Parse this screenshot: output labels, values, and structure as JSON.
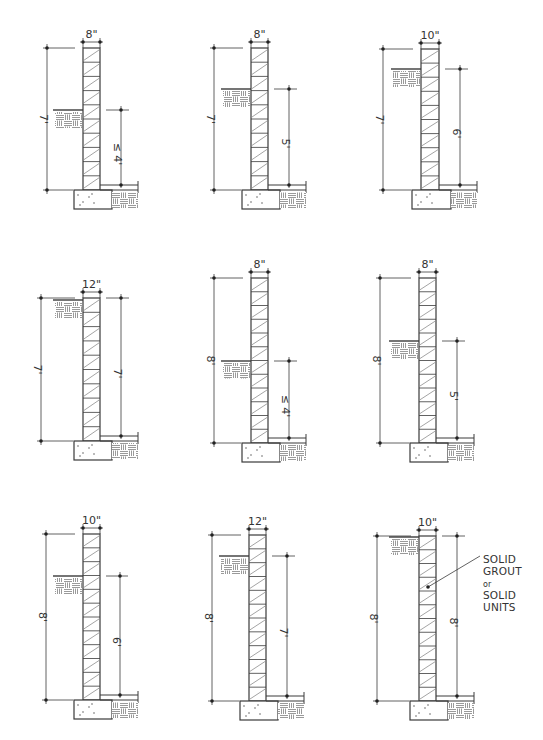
{
  "diagram": {
    "colors": {
      "line": "#3a3a3a",
      "hatch": "#555555",
      "background": "#ffffff"
    },
    "panels": [
      {
        "id": 1,
        "row": 1,
        "col": 1,
        "wall_thickness": "8\"",
        "total_height": "7'",
        "backfill_height": "≤ 4'",
        "backfill_prefix": "≤",
        "backfill_value": "4'",
        "geom": {
          "wallL": 83,
          "wallR": 100,
          "top": 48,
          "base": 190,
          "grade": 110,
          "leftDimX": 47,
          "rightDimX": 121
        }
      },
      {
        "id": 2,
        "row": 1,
        "col": 2,
        "wall_thickness": "8\"",
        "total_height": "7'",
        "backfill_height": "5'",
        "backfill_prefix": "",
        "backfill_value": "5'",
        "geom": {
          "wallL": 251,
          "wallR": 268,
          "top": 48,
          "base": 190,
          "grade": 89,
          "leftDimX": 214,
          "rightDimX": 289
        }
      },
      {
        "id": 3,
        "row": 1,
        "col": 3,
        "wall_thickness": "10\"",
        "total_height": "7'",
        "backfill_height": "6'",
        "backfill_prefix": "",
        "backfill_value": "6'",
        "geom": {
          "wallL": 421,
          "wallR": 439,
          "top": 49,
          "base": 190,
          "grade": 69,
          "leftDimX": 383,
          "rightDimX": 460
        }
      },
      {
        "id": 4,
        "row": 2,
        "col": 1,
        "wall_thickness": "12\"",
        "total_height": "7'",
        "backfill_height": "7'",
        "backfill_prefix": "",
        "backfill_value": "7'",
        "geom": {
          "wallL": 83,
          "wallR": 100,
          "top": 298,
          "base": 441,
          "grade": 300,
          "leftDimX": 41,
          "rightDimX": 121
        }
      },
      {
        "id": 5,
        "row": 2,
        "col": 2,
        "wall_thickness": "8\"",
        "total_height": "8'",
        "backfill_height": "≤ 4'",
        "backfill_prefix": "≤",
        "backfill_value": "4'",
        "geom": {
          "wallL": 251,
          "wallR": 268,
          "top": 278,
          "base": 443,
          "grade": 361,
          "leftDimX": 214,
          "rightDimX": 289
        }
      },
      {
        "id": 6,
        "row": 2,
        "col": 3,
        "wall_thickness": "8\"",
        "total_height": "8'",
        "backfill_height": "5'",
        "backfill_prefix": "",
        "backfill_value": "5'",
        "geom": {
          "wallL": 419,
          "wallR": 436,
          "top": 278,
          "base": 443,
          "grade": 341,
          "leftDimX": 380,
          "rightDimX": 457
        }
      },
      {
        "id": 7,
        "row": 3,
        "col": 1,
        "wall_thickness": "10\"",
        "total_height": "8'",
        "backfill_height": "6'",
        "backfill_prefix": "",
        "backfill_value": "6'",
        "geom": {
          "wallL": 83,
          "wallR": 100,
          "top": 534,
          "base": 700,
          "grade": 576,
          "leftDimX": 46,
          "rightDimX": 120
        }
      },
      {
        "id": 8,
        "row": 3,
        "col": 2,
        "wall_thickness": "12\"",
        "total_height": "8'",
        "backfill_height": "7'",
        "backfill_prefix": "",
        "backfill_value": "7'",
        "geom": {
          "wallL": 249,
          "wallR": 266,
          "top": 535,
          "base": 701,
          "grade": 556,
          "leftDimX": 212,
          "rightDimX": 287
        }
      },
      {
        "id": 9,
        "row": 3,
        "col": 3,
        "wall_thickness": "10\"",
        "total_height": "8'",
        "backfill_height": "8'",
        "backfill_prefix": "",
        "backfill_value": "8'",
        "geom": {
          "wallL": 419,
          "wallR": 436,
          "top": 536,
          "base": 701,
          "grade": 537,
          "leftDimX": 377,
          "rightDimX": 457
        }
      }
    ],
    "callout": {
      "panel": 9,
      "lines": [
        "SOLID",
        "GROUT",
        "or",
        "SOLID",
        "UNITS"
      ]
    }
  }
}
